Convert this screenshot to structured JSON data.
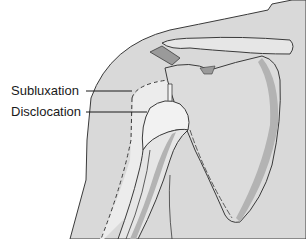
{
  "diagram": {
    "labels": [
      {
        "id": "subluxation",
        "text": "Subluxation"
      },
      {
        "id": "disclocation",
        "text": "Disclocation"
      }
    ],
    "colors": {
      "background": "#ffffff",
      "skin": "#d9d9d9",
      "bone": "#e6e6e6",
      "bone_shadow": "#b3b3b3",
      "outline": "#3a3a3a",
      "label_text": "#1a1a1a"
    }
  }
}
